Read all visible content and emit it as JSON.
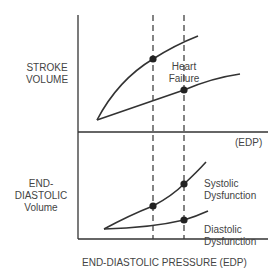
{
  "top_panel": {
    "y_label_line1": "STROKE",
    "y_label_line2": "VOLUME",
    "curve_label_line1": "Heart",
    "curve_label_line2": "Failure",
    "x_label": "(EDP)"
  },
  "bottom_panel": {
    "y_label_line1": "END-",
    "y_label_line2": "DIASTOLIC",
    "y_label_line3": "Volume",
    "systolic_label_line1": "Systolic",
    "systolic_label_line2": "Dysfunction",
    "diastolic_label_line1": "Diastolic",
    "diastolic_label_line2": "Dysfunction",
    "x_label": "END-DIASTOLIC PRESSURE (EDP)"
  },
  "colors": {
    "line": "#333333",
    "text": "#444444",
    "background": "#ffffff"
  }
}
